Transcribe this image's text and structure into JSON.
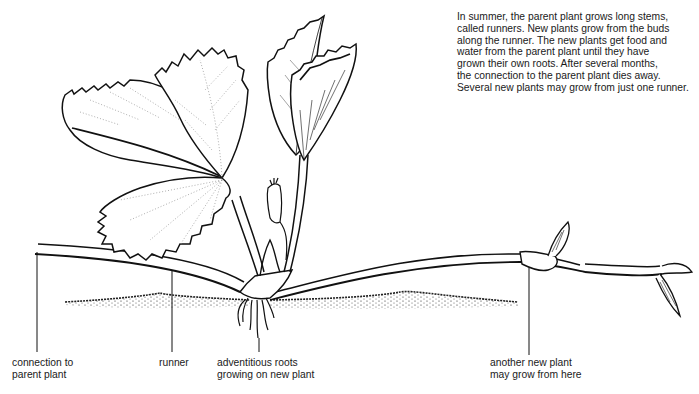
{
  "description": {
    "lines": [
      "In summer, the parent plant grows long stems,",
      "called runners. New plants grow from the buds",
      "along the runner. The new plants get food and",
      "water from the parent plant until they have",
      "grown their own roots. After several months,",
      "the connection to the parent plant dies away.",
      "Several new plants may grow from just one runner."
    ]
  },
  "labels": {
    "connection": {
      "line1": "connection to",
      "line2": "parent plant"
    },
    "runner": {
      "line1": "runner"
    },
    "roots": {
      "line1": "adventitious roots",
      "line2": "growing on new plant"
    },
    "another": {
      "line1": "another new plant",
      "line2": "may grow from here"
    }
  },
  "colors": {
    "ink": "#1a1a1a",
    "background": "#ffffff"
  }
}
